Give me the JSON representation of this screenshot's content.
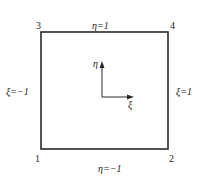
{
  "diagram": {
    "nodes": [
      {
        "id": "1",
        "label": "1"
      },
      {
        "id": "2",
        "label": "2"
      },
      {
        "id": "3",
        "label": "3"
      },
      {
        "id": "4",
        "label": "4"
      }
    ],
    "edges": {
      "top": "η=1",
      "bottom": "η=−1",
      "left": "ξ=−1",
      "right": "ξ=1"
    },
    "axes": {
      "vertical": "η",
      "horizontal": "ξ"
    },
    "colors": {
      "line": "#2a2a2a",
      "text": "#222222",
      "background": "#ffffff"
    }
  }
}
